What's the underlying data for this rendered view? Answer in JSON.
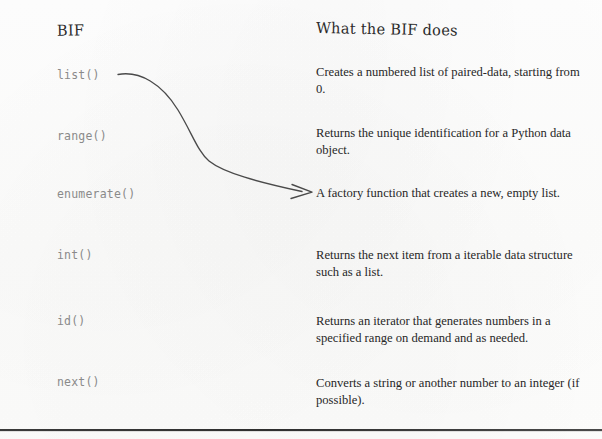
{
  "page": {
    "background_color": "#fdfdfd",
    "text_color": "#272727",
    "code_text_color": "#8a8a8a",
    "rule_color": "#333333"
  },
  "columns": {
    "left_header": "BIF",
    "right_header": "What the BIF does"
  },
  "rows": [
    {
      "bif": "list()",
      "description": "Creates a numbered list of paired-data, starting from 0."
    },
    {
      "bif": "range()",
      "description": "Returns the unique identification for a Python data object."
    },
    {
      "bif": "enumerate()",
      "description": "A factory function that creates a new, empty list."
    },
    {
      "bif": "int()",
      "description": "Returns the next item from a iterable data structure such as a list."
    },
    {
      "bif": "id()",
      "description": "Returns an iterator that generates numbers in a specified range on demand and as needed."
    },
    {
      "bif": "next()",
      "description": "Converts a string or another number to an integer (if possible)."
    }
  ],
  "annotation": {
    "arrow": {
      "name": "curved-matching-arrow",
      "from_label": "list()",
      "to_label": "A factory function that creates a new, empty list.",
      "color": "#4a4a4a"
    }
  }
}
